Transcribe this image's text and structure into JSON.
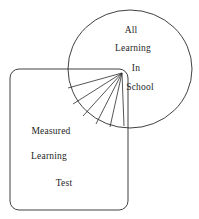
{
  "diagram": {
    "type": "venn-overlap-diagram",
    "background_color": "#ffffff",
    "stroke_color": "#2b2b2b",
    "text_color": "#1e1e1e",
    "ellipse": {
      "name": "all-learning-in-school",
      "labels": [
        {
          "text": "All",
          "x": 131,
          "y": 30
        },
        {
          "text": "Learning",
          "x": 133,
          "y": 48
        },
        {
          "text": "In",
          "x": 136,
          "y": 68
        },
        {
          "text": "School",
          "x": 140,
          "y": 87
        }
      ],
      "geometry": {
        "cx": 130,
        "cy": 69,
        "rx": 62,
        "ry": 59
      }
    },
    "rectangle": {
      "name": "measured-learning-test",
      "labels": [
        {
          "text": "Measured",
          "x": 51,
          "y": 131
        },
        {
          "text": "Learning",
          "x": 49,
          "y": 156
        },
        {
          "text": "Test",
          "x": 64,
          "y": 183
        }
      ],
      "geometry": {
        "x": 10,
        "y": 69,
        "width": 118,
        "height": 141,
        "radius": 9
      }
    },
    "fan": {
      "name": "radiating-fan-lines",
      "origin": {
        "x": 122,
        "y": 73
      },
      "line_count": 6,
      "endpoints": [
        {
          "x": 68,
          "y": 88
        },
        {
          "x": 73,
          "y": 104
        },
        {
          "x": 83,
          "y": 116
        },
        {
          "x": 96,
          "y": 124
        },
        {
          "x": 110,
          "y": 127
        },
        {
          "x": 124,
          "y": 126
        }
      ]
    }
  }
}
